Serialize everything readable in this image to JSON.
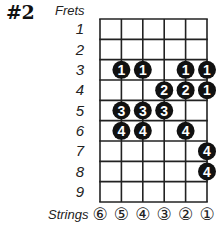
{
  "diagram": {
    "title": "#2",
    "frets_label": "Frets",
    "strings_label": "Strings",
    "fret_numbers": [
      "1",
      "2",
      "3",
      "4",
      "5",
      "6",
      "7",
      "8",
      "9"
    ],
    "string_labels": [
      "⑥",
      "⑤",
      "④",
      "③",
      "②",
      "①"
    ],
    "grid": {
      "left": 100,
      "right": 207,
      "top": 19,
      "bottom": 202,
      "num_strings": 6,
      "num_frets": 9,
      "line_color": "#222222"
    },
    "dot_color": "#111111",
    "dot_text_color": "#ffffff",
    "dots": [
      {
        "fret": 3,
        "string": 5,
        "finger": "1"
      },
      {
        "fret": 3,
        "string": 4,
        "finger": "1"
      },
      {
        "fret": 3,
        "string": 2,
        "finger": "1"
      },
      {
        "fret": 3,
        "string": 1,
        "finger": "1"
      },
      {
        "fret": 4,
        "string": 3,
        "finger": "2"
      },
      {
        "fret": 4,
        "string": 2,
        "finger": "2"
      },
      {
        "fret": 4,
        "string": 1,
        "finger": "1"
      },
      {
        "fret": 5,
        "string": 5,
        "finger": "3"
      },
      {
        "fret": 5,
        "string": 4,
        "finger": "3"
      },
      {
        "fret": 5,
        "string": 3,
        "finger": "3"
      },
      {
        "fret": 6,
        "string": 5,
        "finger": "4"
      },
      {
        "fret": 6,
        "string": 4,
        "finger": "4"
      },
      {
        "fret": 6,
        "string": 2,
        "finger": "4"
      },
      {
        "fret": 7,
        "string": 1,
        "finger": "4"
      },
      {
        "fret": 8,
        "string": 1,
        "finger": "4"
      }
    ]
  }
}
